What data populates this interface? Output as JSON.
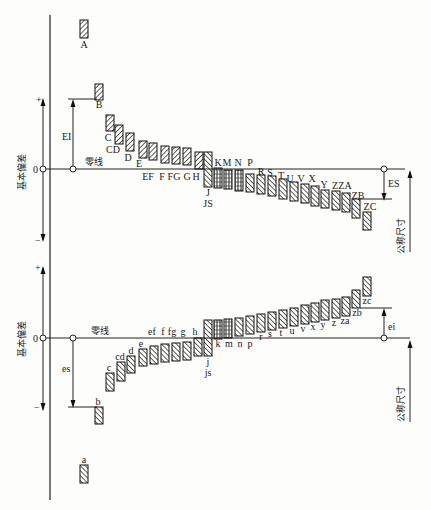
{
  "upper": {
    "title": "基本偏差",
    "zero_label": "0",
    "plus": "+",
    "minus": "−",
    "zero_line_label": "零线",
    "dim_label": "EI",
    "right_dim_label": "ES",
    "nominal_label": "公称尺寸",
    "bars": [
      {
        "label": "A",
        "x": 80,
        "y1": 20,
        "y2": 38,
        "lx": 84,
        "ly": 48
      },
      {
        "label": "B",
        "x": 95,
        "y1": 84,
        "y2": 100,
        "lx": 99,
        "ly": 108
      },
      {
        "label": "C",
        "x": 106,
        "y1": 115,
        "y2": 131,
        "lx": 108,
        "ly": 141
      },
      {
        "label": "CD",
        "x": 115,
        "y1": 125,
        "y2": 144,
        "lx": 113,
        "ly": 153
      },
      {
        "label": "D",
        "x": 126,
        "y1": 133,
        "y2": 151,
        "lx": 128,
        "ly": 161
      },
      {
        "label": "E",
        "x": 139,
        "y1": 141,
        "y2": 158,
        "lx": 139,
        "ly": 167
      },
      {
        "label": "EF",
        "x": 149,
        "y1": 143,
        "y2": 160,
        "lx": 148,
        "ly": 180
      },
      {
        "label": "F",
        "x": 161,
        "y1": 146,
        "y2": 163,
        "lx": 162,
        "ly": 180
      },
      {
        "label": "FG",
        "x": 172,
        "y1": 147,
        "y2": 164,
        "lx": 174,
        "ly": 180
      },
      {
        "label": "G",
        "x": 183,
        "y1": 148,
        "y2": 165,
        "lx": 187,
        "ly": 180
      },
      {
        "label": "H",
        "x": 195,
        "y1": 152,
        "y2": 169,
        "lx": 196,
        "ly": 180
      }
    ],
    "js_bar": {
      "label_j": "J",
      "label_js": "JS",
      "x": 204,
      "y1": 152,
      "y2": 187
    },
    "neg_bars": [
      {
        "label": "K",
        "x": 214,
        "y1": 168,
        "y2": 188
      },
      {
        "label": "M",
        "x": 224,
        "y1": 170,
        "y2": 189
      },
      {
        "label": "N",
        "x": 235,
        "y1": 170,
        "y2": 191
      },
      {
        "label": "P",
        "x": 246,
        "y1": 174,
        "y2": 192
      },
      {
        "label": "R",
        "x": 257,
        "y1": 175,
        "y2": 194
      },
      {
        "label": "S",
        "x": 268,
        "y1": 176,
        "y2": 196
      },
      {
        "label": "T",
        "x": 279,
        "y1": 179,
        "y2": 199
      },
      {
        "label": "U",
        "x": 290,
        "y1": 182,
        "y2": 201
      },
      {
        "label": "V",
        "x": 301,
        "y1": 184,
        "y2": 203
      },
      {
        "label": "X",
        "x": 311,
        "y1": 186,
        "y2": 206
      },
      {
        "label": "Y",
        "x": 321,
        "y1": 190,
        "y2": 208
      },
      {
        "label": "Z",
        "x": 332,
        "y1": 191,
        "y2": 210
      },
      {
        "label": "ZA",
        "x": 342,
        "y1": 193,
        "y2": 212
      },
      {
        "label": "ZB",
        "x": 352,
        "y1": 199,
        "y2": 218
      },
      {
        "label": "ZC",
        "x": 363,
        "y1": 212,
        "y2": 230
      }
    ],
    "neg_labels": [
      {
        "text": "K",
        "x": 218,
        "y": 166
      },
      {
        "text": "M",
        "x": 227,
        "y": 166
      },
      {
        "text": "N",
        "x": 238,
        "y": 166
      },
      {
        "text": "P",
        "x": 250,
        "y": 166
      },
      {
        "text": "R",
        "x": 261,
        "y": 175
      },
      {
        "text": "S",
        "x": 270,
        "y": 176
      },
      {
        "text": "T",
        "x": 281,
        "y": 179
      },
      {
        "text": "U",
        "x": 290,
        "y": 182
      },
      {
        "text": "V",
        "x": 301,
        "y": 182
      },
      {
        "text": "X",
        "x": 312,
        "y": 182
      },
      {
        "text": "Y",
        "x": 324,
        "y": 188
      },
      {
        "text": "Z",
        "x": 335,
        "y": 189
      },
      {
        "text": "ZA",
        "x": 345,
        "y": 189
      },
      {
        "text": "ZB",
        "x": 358,
        "y": 199
      },
      {
        "text": "ZC",
        "x": 370,
        "y": 210
      }
    ]
  },
  "lower": {
    "title": "基本偏差",
    "zero_label": "0",
    "plus": "+",
    "minus": "−",
    "zero_line_label": "零线",
    "dim_label": "es",
    "right_dim_label": "ei",
    "nominal_label": "公称尺寸",
    "neg_bars": [
      {
        "label": "a",
        "x": 80,
        "y1": 465,
        "y2": 483,
        "lx": 84,
        "ly": 463
      },
      {
        "label": "b",
        "x": 95,
        "y1": 407,
        "y2": 424,
        "lx": 98,
        "ly": 405
      },
      {
        "label": "c",
        "x": 106,
        "y1": 373,
        "y2": 391,
        "lx": 109,
        "ly": 371
      },
      {
        "label": "cd",
        "x": 117,
        "y1": 362,
        "y2": 381,
        "lx": 120,
        "ly": 360
      },
      {
        "label": "d",
        "x": 127,
        "y1": 356,
        "y2": 373,
        "lx": 131,
        "ly": 354
      },
      {
        "label": "e",
        "x": 139,
        "y1": 349,
        "y2": 366,
        "lx": 141,
        "ly": 347
      },
      {
        "label": "ef",
        "x": 150,
        "y1": 346,
        "y2": 364,
        "lx": 152,
        "ly": 335
      },
      {
        "label": "f",
        "x": 161,
        "y1": 344,
        "y2": 362,
        "lx": 163,
        "ly": 335
      },
      {
        "label": "fg",
        "x": 172,
        "y1": 343,
        "y2": 361,
        "lx": 172,
        "ly": 335
      },
      {
        "label": "g",
        "x": 183,
        "y1": 342,
        "y2": 360,
        "lx": 183,
        "ly": 335
      },
      {
        "label": "h",
        "x": 194,
        "y1": 338,
        "y2": 356,
        "lx": 195,
        "ly": 335
      }
    ],
    "js_bar": {
      "label_j": "j",
      "label_js": "js",
      "x": 204,
      "y1": 320,
      "y2": 356
    },
    "pos_bars": [
      {
        "label": "k",
        "x": 214,
        "y1": 320,
        "y2": 339
      },
      {
        "label": "m",
        "x": 224,
        "y1": 319,
        "y2": 338
      },
      {
        "label": "n",
        "x": 235,
        "y1": 318,
        "y2": 336
      },
      {
        "label": "p",
        "x": 246,
        "y1": 316,
        "y2": 334
      },
      {
        "label": "r",
        "x": 257,
        "y1": 314,
        "y2": 332
      },
      {
        "label": "s",
        "x": 268,
        "y1": 312,
        "y2": 330
      },
      {
        "label": "t",
        "x": 279,
        "y1": 310,
        "y2": 328
      },
      {
        "label": "u",
        "x": 290,
        "y1": 308,
        "y2": 326
      },
      {
        "label": "v",
        "x": 301,
        "y1": 305,
        "y2": 324
      },
      {
        "label": "x",
        "x": 311,
        "y1": 303,
        "y2": 322
      },
      {
        "label": "y",
        "x": 321,
        "y1": 300,
        "y2": 320
      },
      {
        "label": "z",
        "x": 332,
        "y1": 299,
        "y2": 318
      },
      {
        "label": "za",
        "x": 342,
        "y1": 297,
        "y2": 316
      },
      {
        "label": "zb",
        "x": 352,
        "y1": 290,
        "y2": 308
      },
      {
        "label": "zc",
        "x": 363,
        "y1": 277,
        "y2": 296
      }
    ],
    "pos_labels": [
      {
        "text": "k",
        "x": 218,
        "y": 347
      },
      {
        "text": "m",
        "x": 229,
        "y": 347
      },
      {
        "text": "n",
        "x": 240,
        "y": 347
      },
      {
        "text": "p",
        "x": 250,
        "y": 347
      },
      {
        "text": "r",
        "x": 261,
        "y": 340
      },
      {
        "text": "s",
        "x": 270,
        "y": 337
      },
      {
        "text": "t",
        "x": 281,
        "y": 336
      },
      {
        "text": "u",
        "x": 292,
        "y": 334
      },
      {
        "text": "v",
        "x": 303,
        "y": 332
      },
      {
        "text": "x",
        "x": 313,
        "y": 330
      },
      {
        "text": "y",
        "x": 323,
        "y": 328
      },
      {
        "text": "z",
        "x": 334,
        "y": 326
      },
      {
        "text": "za",
        "x": 345,
        "y": 324
      },
      {
        "text": "zb",
        "x": 357,
        "y": 316
      },
      {
        "text": "zc",
        "x": 367,
        "y": 304
      }
    ]
  }
}
